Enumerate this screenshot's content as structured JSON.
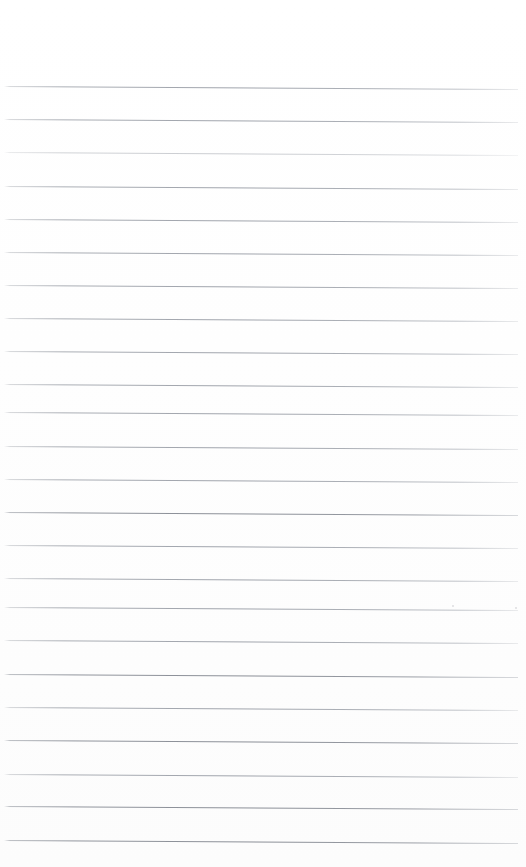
{
  "document": {
    "kind": "scanned-ruled-notebook-page",
    "title": "",
    "page_text": "",
    "visible_text_blocks": [],
    "background_color": "#ffffff",
    "rule_color": "#a0a4ac",
    "page_width": 526,
    "page_height": 867
  },
  "ruling": {
    "line_count": 23,
    "line_spacing_px": 33,
    "first_line_y": 86,
    "line_start_x": 4,
    "line_end_x": 518,
    "line_thickness_px": 1,
    "skew_degrees": 0.33,
    "lines": [
      {
        "y": 86,
        "weight": "normal"
      },
      {
        "y": 119,
        "weight": "normal"
      },
      {
        "y": 152,
        "weight": "faint"
      },
      {
        "y": 186,
        "weight": "normal"
      },
      {
        "y": 219,
        "weight": "normal"
      },
      {
        "y": 252,
        "weight": "normal"
      },
      {
        "y": 285,
        "weight": "normal"
      },
      {
        "y": 318,
        "weight": "normal"
      },
      {
        "y": 351,
        "weight": "normal"
      },
      {
        "y": 384,
        "weight": "normal"
      },
      {
        "y": 412,
        "weight": "normal"
      },
      {
        "y": 446,
        "weight": "normal"
      },
      {
        "y": 479,
        "weight": "normal"
      },
      {
        "y": 512,
        "weight": "strong"
      },
      {
        "y": 545,
        "weight": "normal"
      },
      {
        "y": 578,
        "weight": "normal"
      },
      {
        "y": 607,
        "weight": "normal"
      },
      {
        "y": 640,
        "weight": "normal"
      },
      {
        "y": 674,
        "weight": "strong"
      },
      {
        "y": 707,
        "weight": "normal"
      },
      {
        "y": 740,
        "weight": "strong"
      },
      {
        "y": 774,
        "weight": "normal"
      },
      {
        "y": 806,
        "weight": "strong"
      },
      {
        "y": 840,
        "weight": "strong"
      }
    ]
  },
  "artifacts": {
    "specks": [
      {
        "x": 515,
        "y": 607,
        "size": "tiny"
      },
      {
        "x": 452,
        "y": 605,
        "size": "tiny"
      }
    ]
  },
  "margins": {
    "top_margin_px": 86,
    "bottom_margin_px": 27,
    "left_margin_px": 4,
    "right_margin_px": 8,
    "vertical_margin_rule": "none"
  }
}
